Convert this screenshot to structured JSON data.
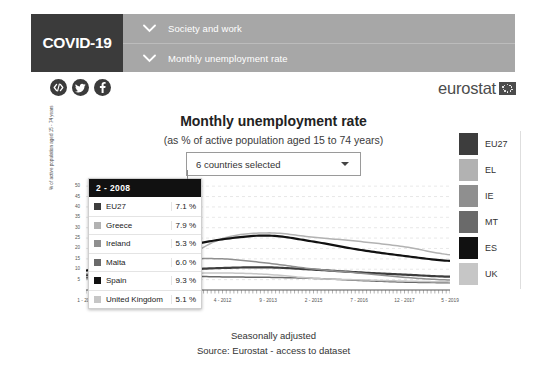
{
  "header": {
    "badge_label": "COVID-19",
    "nav_items": [
      {
        "label": "Society and work",
        "icon": "chevron-down-icon"
      },
      {
        "label": "Monthly unemployment rate",
        "icon": "chevron-down-icon"
      }
    ],
    "social_icons": [
      "embed-code-icon",
      "twitter-icon",
      "facebook-icon"
    ],
    "brand": "eurostat",
    "colors": {
      "badge_bg": "#3b3b3b",
      "nav_bg": "#a7a7a7",
      "brand_text": "#4c4c4c"
    }
  },
  "chart_header": {
    "title": "Monthly unemployment rate",
    "subtitle": "(as % of active population aged 15 to 74 years)",
    "select_value": "6 countries selected",
    "select_icon": "chevron-down-icon"
  },
  "tooltip": {
    "period": "2 - 2008",
    "rows": [
      {
        "name": "EU27",
        "value": "7.1 %",
        "color": "#3d3d3d"
      },
      {
        "name": "Greece",
        "value": "7.9 %",
        "color": "#b2b2b2"
      },
      {
        "name": "Ireland",
        "value": "5.3 %",
        "color": "#8f8f8f"
      },
      {
        "name": "Malta",
        "value": "6.0 %",
        "color": "#6a6a6a"
      },
      {
        "name": "Spain",
        "value": "9.3 %",
        "color": "#111111"
      },
      {
        "name": "United Kingdom",
        "value": "5.1 %",
        "color": "#c6c6c6"
      }
    ]
  },
  "legend": {
    "items": [
      {
        "label": "EU27",
        "color": "#3d3d3d"
      },
      {
        "label": "EL",
        "color": "#b2b2b2"
      },
      {
        "label": "IE",
        "color": "#8f8f8f"
      },
      {
        "label": "MT",
        "color": "#6a6a6a"
      },
      {
        "label": "ES",
        "color": "#111111"
      },
      {
        "label": "UK",
        "color": "#c6c6c6"
      }
    ]
  },
  "footer": {
    "line1": "Seasonally adjusted",
    "source_prefix": "Source: Eurostat",
    "source_link": "- access to dataset"
  },
  "chart_data": {
    "type": "line",
    "title": "Monthly unemployment rate",
    "subtitle": "(as % of active population aged 15 to 74 years)",
    "xlabel": "",
    "ylabel": "% of active population aged 15 - 74 years",
    "ylim": [
      0,
      52
    ],
    "yticks": [
      5,
      10,
      15,
      20,
      25,
      30,
      35,
      40,
      45,
      50
    ],
    "xticks": [
      "1 - 2008",
      "6 - 2009",
      "11 - 2010",
      "4 - 2012",
      "9 - 2013",
      "2 - 2015",
      "7 - 2016",
      "12 - 2017",
      "5 - 2019"
    ],
    "grid": true,
    "legend_position": "right",
    "annotation": "2 - 2008 values: EU27 7.1 %, Greece 7.9 %, Ireland 5.3 %, Malta 6.0 %, Spain 9.3 %, United Kingdom 5.1 %",
    "x": [
      "1 - 2008",
      "6 - 2009",
      "11 - 2010",
      "4 - 2012",
      "9 - 2013",
      "2 - 2015",
      "7 - 2016",
      "12 - 2017",
      "5 - 2019"
    ],
    "series": [
      {
        "name": "EU27",
        "code": "EU27",
        "color": "#3d3d3d",
        "values": [
          7.1,
          9.2,
          9.7,
          10.6,
          10.9,
          9.8,
          8.5,
          7.4,
          6.4
        ]
      },
      {
        "name": "Greece",
        "code": "EL",
        "color": "#b2b2b2",
        "values": [
          7.9,
          9.6,
          14.0,
          24.8,
          27.5,
          25.4,
          23.4,
          20.8,
          17.0
        ]
      },
      {
        "name": "Ireland",
        "code": "IE",
        "color": "#8f8f8f",
        "values": [
          5.3,
          12.2,
          14.6,
          15.0,
          12.9,
          10.1,
          8.2,
          6.1,
          4.8
        ]
      },
      {
        "name": "Malta",
        "code": "MT",
        "color": "#6a6a6a",
        "values": [
          6.0,
          6.9,
          6.8,
          6.3,
          6.1,
          5.6,
          4.6,
          3.8,
          3.5
        ]
      },
      {
        "name": "Spain",
        "code": "ES",
        "color": "#111111",
        "values": [
          9.3,
          18.1,
          20.6,
          24.4,
          26.2,
          23.3,
          19.4,
          16.4,
          14.0
        ]
      },
      {
        "name": "United Kingdom",
        "code": "UK",
        "color": "#c6c6c6",
        "values": [
          5.1,
          7.7,
          7.9,
          8.2,
          7.5,
          5.6,
          4.9,
          4.3,
          3.9
        ]
      }
    ]
  }
}
